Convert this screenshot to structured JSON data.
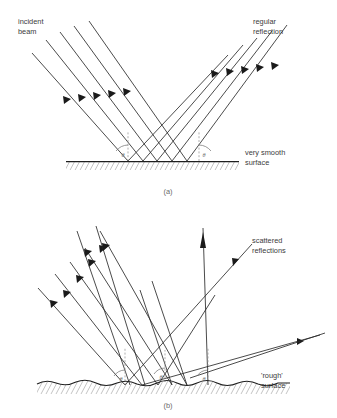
{
  "figure": {
    "background_color": "#ffffff",
    "ray_color": "#2b2b2b",
    "label_color": "#3b3b3b",
    "caption_color": "#6a6a6a",
    "normal_color": "#8c8c8c"
  },
  "panels": [
    {
      "id": "a",
      "caption": "(a)",
      "description": "Specular (regular) reflection from a very smooth surface",
      "labels": {
        "incident": "incident\nbeam",
        "incident_line1": "incident",
        "incident_line2": "beam",
        "reflected_line1": "regular",
        "reflected_line2": "reflection",
        "surface_line1": "very smooth",
        "surface_line2": "surface"
      },
      "angles": {
        "incidence_symbol": "θ",
        "reflection_symbol": "θ",
        "relation": "angle of incidence equals angle of reflection"
      },
      "ray_count_incident": 5,
      "ray_count_reflected": 5
    },
    {
      "id": "b",
      "caption": "(b)",
      "description": "Diffuse (scattered) reflection from a rough surface",
      "labels": {
        "scattered_line1": "scattered",
        "scattered_line2": "reflections",
        "surface_line1": "'rough'",
        "surface_line2": "surface"
      },
      "angles": {
        "symbol_1": "θ",
        "symbol_2": "θ",
        "symbol_3": "θ"
      },
      "ray_count_incident": 5,
      "ray_count_scattered": 5
    }
  ]
}
